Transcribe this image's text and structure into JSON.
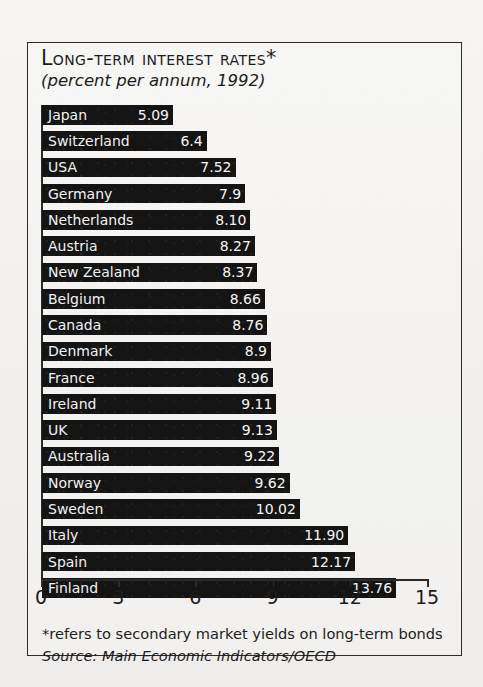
{
  "figure": {
    "title": "Long-term Interest Rates*",
    "subtitle": "(percent per annum, 1992)",
    "footnote": "*refers to secondary market yields on long-term bonds",
    "source": "Source: Main Economic Indicators/OECD"
  },
  "axis": {
    "ticks": [
      "0",
      "3",
      "6",
      "9",
      "12",
      "15"
    ]
  },
  "colors": {
    "bar": "#141414",
    "bar_text": "#f2f2f2",
    "frame": "#2b2b2b",
    "paper": "#f4f3f1"
  },
  "chart_data": {
    "type": "bar",
    "orientation": "horizontal",
    "title": "Long-term Interest Rates*",
    "subtitle": "(percent per annum, 1992)",
    "xlabel": "",
    "ylabel": "",
    "xlim": [
      0,
      15
    ],
    "xticks": [
      0,
      3,
      6,
      9,
      12,
      15
    ],
    "grid": false,
    "legend": false,
    "value_labels": true,
    "sorted": "ascending",
    "categories": [
      "Japan",
      "Switzerland",
      "USA",
      "Germany",
      "Netherlands",
      "Austria",
      "New Zealand",
      "Belgium",
      "Canada",
      "Denmark",
      "France",
      "Ireland",
      "UK",
      "Australia",
      "Norway",
      "Sweden",
      "Italy",
      "Spain",
      "Finland"
    ],
    "values": [
      5.09,
      6.4,
      7.52,
      7.9,
      8.1,
      8.27,
      8.37,
      8.66,
      8.76,
      8.9,
      8.96,
      9.11,
      9.13,
      9.22,
      9.62,
      10.02,
      11.9,
      12.17,
      13.76
    ],
    "labels": [
      "5.09",
      "6.4",
      "7.52",
      "7.9",
      "8.10",
      "8.27",
      "8.37",
      "8.66",
      "8.76",
      "8.9",
      "8.96",
      "9.11",
      "9.13",
      "9.22",
      "9.62",
      "10.02",
      "11.90",
      "12.17",
      "13.76"
    ],
    "footnote": "*refers to secondary market yields on long-term bonds",
    "source": "Source: Main Economic Indicators/OECD"
  }
}
